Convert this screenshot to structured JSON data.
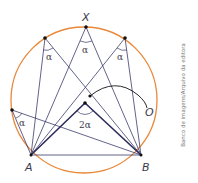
{
  "diagram": {
    "labels": {
      "X": "X",
      "A": "A",
      "B": "B",
      "O": "O",
      "central_angle": "2α",
      "inscribed_angle": "α"
    },
    "colors": {
      "circle": "#e8883a",
      "lines": "#3b3b6b",
      "points": "#111111"
    },
    "credit": "Banco de imagens/Arquivo da editora"
  }
}
